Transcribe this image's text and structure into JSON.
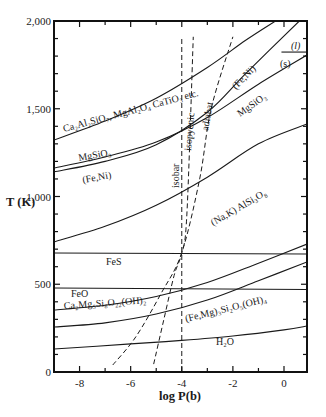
{
  "chart_data": {
    "type": "line",
    "title": "",
    "xlabel": "log P(b)",
    "ylabel": "T (K)",
    "xlim": [
      -9.0,
      0.9
    ],
    "ylim": [
      0,
      2000
    ],
    "grid": false,
    "legend": "none (inline curve labels)",
    "x_ticks": [
      {
        "value": -8,
        "label": "-8"
      },
      {
        "value": -6,
        "label": "-6"
      },
      {
        "value": -4,
        "label": "-4"
      },
      {
        "value": -2,
        "label": "-2"
      },
      {
        "value": 0,
        "label": "0"
      }
    ],
    "y_ticks": [
      {
        "value": 0,
        "label": "0"
      },
      {
        "value": 500,
        "label": "500"
      },
      {
        "value": 1000,
        "label": "1,000"
      },
      {
        "value": 1500,
        "label": "1,500"
      },
      {
        "value": 2000,
        "label": "2,000"
      }
    ],
    "series": [
      {
        "name": "Ca2Al2SiO7, MgAl2O4 CaTiO3 etc.",
        "style": "solid",
        "points": [
          [
            -9.0,
            1322
          ],
          [
            -7.0,
            1430
          ],
          [
            -5.0,
            1560
          ],
          [
            -3.0,
            1735
          ],
          [
            -1.5,
            1890
          ],
          [
            -0.33,
            2000
          ]
        ]
      },
      {
        "name": "MgSiO3",
        "style": "solid",
        "points": [
          [
            -9.0,
            1162
          ],
          [
            -7.0,
            1225
          ],
          [
            -5.0,
            1310
          ],
          [
            -3.0,
            1450
          ],
          [
            -1.0,
            1640
          ],
          [
            0.9,
            1806
          ]
        ]
      },
      {
        "name": "(Fe,Ni)",
        "style": "solid",
        "points": [
          [
            -9.0,
            1140
          ],
          [
            -7.0,
            1200
          ],
          [
            -5.0,
            1295
          ],
          [
            -3.0,
            1480
          ],
          [
            -1.5,
            1700
          ],
          [
            0.6,
            2000
          ]
        ]
      },
      {
        "name": "(l)/(s) boundary",
        "style": "solid",
        "points": [
          [
            -0.1,
            1823
          ],
          [
            0.9,
            1823
          ]
        ]
      },
      {
        "name": "(Na,K) AlSi3O8",
        "style": "solid",
        "points": [
          [
            -9.0,
            741
          ],
          [
            -7.0,
            830
          ],
          [
            -5.0,
            950
          ],
          [
            -3.0,
            1110
          ],
          [
            -1.0,
            1300
          ],
          [
            0.9,
            1413
          ]
        ]
      },
      {
        "name": "FeS",
        "style": "solid",
        "points": [
          [
            -9.0,
            678
          ],
          [
            0.9,
            672
          ]
        ]
      },
      {
        "name": "FeO",
        "style": "solid",
        "points": [
          [
            -9.0,
            479
          ],
          [
            0.9,
            470
          ]
        ]
      },
      {
        "name": "Ca2Mg5Si8O22(OH)2",
        "style": "solid",
        "points": [
          [
            -9.0,
            353
          ],
          [
            -7.0,
            380
          ],
          [
            -5.0,
            430
          ],
          [
            -3.0,
            510
          ],
          [
            -1.0,
            620
          ],
          [
            0.9,
            729
          ]
        ]
      },
      {
        "name": "(Fe,Mg)3Si2O5(OH)4",
        "style": "solid",
        "points": [
          [
            -9.0,
            256
          ],
          [
            -7.0,
            280
          ],
          [
            -5.0,
            330
          ],
          [
            -3.0,
            410
          ],
          [
            -1.0,
            520
          ],
          [
            0.9,
            627
          ]
        ]
      },
      {
        "name": "H2O",
        "style": "solid",
        "points": [
          [
            -9.0,
            131
          ],
          [
            -6.0,
            160
          ],
          [
            -4.0,
            180
          ],
          [
            -2.0,
            205
          ],
          [
            0.0,
            240
          ],
          [
            0.9,
            262
          ]
        ]
      },
      {
        "name": "isobar",
        "style": "dashed",
        "points": [
          [
            -4.0,
            0
          ],
          [
            -4.0,
            1910
          ]
        ]
      },
      {
        "name": "isopycnic",
        "style": "dashed",
        "points": [
          [
            -5.1,
            45
          ],
          [
            -4.7,
            300
          ],
          [
            -4.3,
            550
          ],
          [
            -4.0,
            680
          ],
          [
            -3.8,
            900
          ],
          [
            -3.55,
            1910
          ]
        ]
      },
      {
        "name": "adiabat",
        "style": "dashed",
        "points": [
          [
            -6.7,
            40
          ],
          [
            -5.8,
            200
          ],
          [
            -4.8,
            450
          ],
          [
            -4.0,
            680
          ],
          [
            -3.3,
            1100
          ],
          [
            -2.85,
            1500
          ],
          [
            -2.0,
            1910
          ]
        ]
      }
    ]
  },
  "axes": {
    "x_title": "log P(b)",
    "y_title": "T (K)"
  },
  "labels": {
    "ca2al2sio7": "Ca₂Al₂SiO₇, MgAl₂O₄ CaTiO₃ etc.",
    "feni_upper": "(Fe,Ni)",
    "liquid": "(l)",
    "solid": "(s)",
    "mgsio3_right": "MgSiO₃",
    "mgsio3_left": "MgSiO₃",
    "feni_left": "(Fe,Ni)",
    "nak": "(Na,K) AlSi₃O₈",
    "isobar": "isobar",
    "isopycnic": "isopycnic",
    "adiabat": "adiabat",
    "fes": "FeS",
    "feo": "FeO",
    "tremolite": "Ca₂Mg₅Si₈O₂₂(OH)₂",
    "serpentine": "(Fe,Mg)₃Si₂O₅(OH)₄",
    "h2o": "H₂O"
  }
}
